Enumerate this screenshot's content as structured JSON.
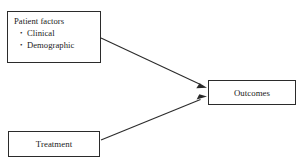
{
  "diagram": {
    "type": "flow-diagram",
    "background_color": "#ffffff",
    "line_color": "#2b2b2b",
    "text_color": "#1a1a1a",
    "nodes": [
      {
        "id": "patient-factors",
        "heading": "Patient factors",
        "bullets": [
          "Clinical",
          "Demographic"
        ]
      },
      {
        "id": "treatment",
        "label": "Treatment"
      },
      {
        "id": "outcomes",
        "label": "Outcomes"
      }
    ],
    "edges": [
      {
        "id": "patient-factors-to-outcomes",
        "from": "patient-factors",
        "to": "outcomes",
        "style": "solid",
        "arrowhead": "filled-triangle"
      },
      {
        "id": "treatment-to-outcomes",
        "from": "treatment",
        "to": "outcomes",
        "style": "solid",
        "arrowhead": "filled-triangle"
      }
    ]
  }
}
